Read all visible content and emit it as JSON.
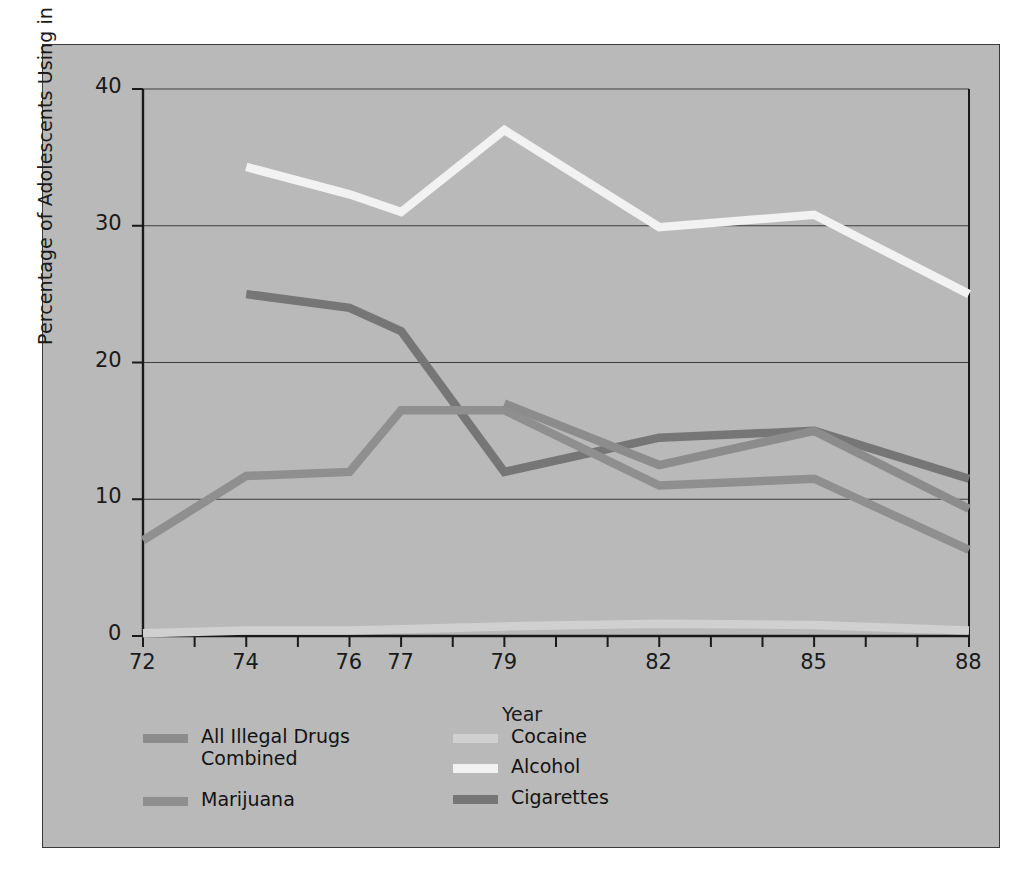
{
  "chart_data": {
    "type": "line",
    "title": "",
    "xlabel": "Year",
    "ylabel": "Percentage of Adolescents Using in Past Month",
    "x": [
      72,
      73,
      74,
      75,
      76,
      77,
      78,
      79,
      80,
      81,
      82,
      83,
      84,
      85,
      86,
      87,
      88
    ],
    "xticklabels": [
      "72",
      "74",
      "76",
      "77",
      "79",
      "82",
      "85",
      "88"
    ],
    "xtickvalues": [
      72,
      74,
      76,
      77,
      79,
      82,
      85,
      88
    ],
    "yticklabels": [
      "0",
      "10",
      "20",
      "30",
      "40"
    ],
    "ytickvalues": [
      0,
      10,
      20,
      30,
      40
    ],
    "ylim": [
      0,
      40
    ],
    "xlim": [
      72,
      88
    ],
    "grid": "horizontal",
    "legend_position": "below-axes",
    "series": [
      {
        "name": "All Illegal Drugs Combined",
        "color": "#8c8c8c",
        "x": [
          79,
          82,
          85,
          88
        ],
        "values": [
          17.0,
          12.5,
          15.0,
          9.3
        ]
      },
      {
        "name": "Marijuana",
        "color": "#8f8f8f",
        "x": [
          72,
          74,
          76,
          77,
          79,
          82,
          85,
          88
        ],
        "values": [
          7.0,
          11.7,
          12.0,
          16.5,
          16.5,
          11.0,
          11.5,
          6.3
        ]
      },
      {
        "name": "Cocaine",
        "color": "#d0d0d0",
        "x": [
          72,
          74,
          76,
          77,
          79,
          82,
          85,
          88
        ],
        "values": [
          0.2,
          0.4,
          0.4,
          0.5,
          0.7,
          0.9,
          0.8,
          0.4
        ]
      },
      {
        "name": "Alcohol",
        "color": "#f2f2f2",
        "x": [
          74,
          76,
          77,
          79,
          82,
          85,
          88
        ],
        "values": [
          34.3,
          32.3,
          31.0,
          37.0,
          29.9,
          30.8,
          25.0
        ]
      },
      {
        "name": "Cigarettes",
        "color": "#767676",
        "x": [
          74,
          76,
          77,
          79,
          82,
          85,
          88
        ],
        "values": [
          25.0,
          24.0,
          22.3,
          12.0,
          14.5,
          15.0,
          11.5
        ]
      }
    ]
  },
  "legend": {
    "column_left": [
      {
        "label": "All Illegal Drugs Combined",
        "color": "#8c8c8c"
      },
      {
        "label": "Marijuana",
        "color": "#8f8f8f"
      }
    ],
    "column_right": [
      {
        "label": "Cocaine",
        "color": "#d0d0d0"
      },
      {
        "label": "Alcohol",
        "color": "#f2f2f2"
      },
      {
        "label": "Cigarettes",
        "color": "#767676"
      }
    ]
  },
  "colors": {
    "panel_background": "#b9b9b9",
    "panel_border": "#3a3a3a",
    "axis": "#1a1a1a",
    "gridline": "#3c3c3c",
    "text": "#1a1a1a",
    "page_background": "#ffffff"
  }
}
